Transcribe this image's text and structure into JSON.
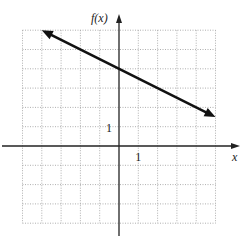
{
  "chart_data": {
    "type": "line",
    "title": "",
    "xlabel": "x",
    "ylabel": "f(x)",
    "xlim": [
      -5,
      5
    ],
    "ylim": [
      -4,
      6
    ],
    "grid": true,
    "tick_labels": {
      "x": "1",
      "y": "1"
    },
    "series": [
      {
        "name": "f(x)",
        "x": [
          -4,
          5
        ],
        "y": [
          6,
          1.5
        ],
        "arrows": "both"
      }
    ]
  }
}
